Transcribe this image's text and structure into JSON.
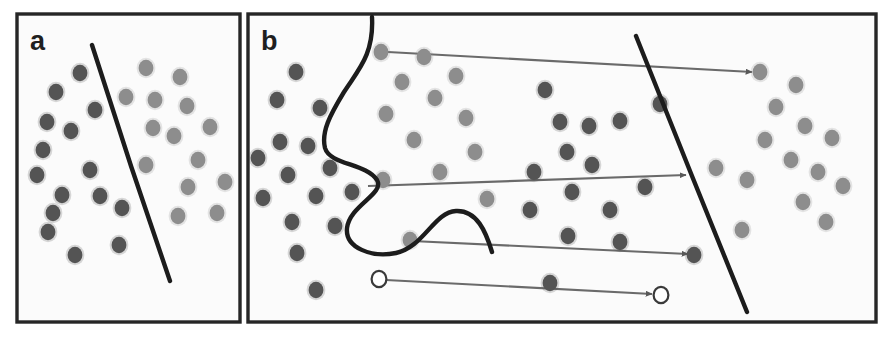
{
  "figure": {
    "background_color": "#ffffff",
    "width": 894,
    "height": 337
  },
  "colors": {
    "panel_border": "#262626",
    "panel_background": "#fbfbfb",
    "boundary_line": "#1c1c1c",
    "dot_class_a": "#545454",
    "dot_class_b": "#8d8d8d",
    "dot_outline_hollow": "#3a3a3a",
    "dot_hollow_fill": "#ffffff",
    "arrow": "#6a6a6a",
    "label_text": "#1f1f1f"
  },
  "panels": [
    {
      "id": "a",
      "label": "a",
      "caption": "",
      "box": {
        "x": 17,
        "y": 14,
        "width": 223,
        "height": 308
      },
      "boundary": {
        "type": "line",
        "name": "linear-decision-boundary",
        "path": "M 92 45 L 131 166 L 170 281"
      },
      "dots": [
        {
          "class": "a",
          "x": 47,
          "y": 122
        },
        {
          "class": "a",
          "x": 56,
          "y": 92
        },
        {
          "class": "a",
          "x": 80,
          "y": 73
        },
        {
          "class": "a",
          "x": 43,
          "y": 150
        },
        {
          "class": "a",
          "x": 71,
          "y": 131
        },
        {
          "class": "a",
          "x": 95,
          "y": 110
        },
        {
          "class": "a",
          "x": 37,
          "y": 175
        },
        {
          "class": "a",
          "x": 62,
          "y": 195
        },
        {
          "class": "a",
          "x": 90,
          "y": 170
        },
        {
          "class": "a",
          "x": 100,
          "y": 196
        },
        {
          "class": "a",
          "x": 53,
          "y": 213
        },
        {
          "class": "a",
          "x": 48,
          "y": 232
        },
        {
          "class": "a",
          "x": 75,
          "y": 255
        },
        {
          "class": "a",
          "x": 122,
          "y": 208
        },
        {
          "class": "a",
          "x": 119,
          "y": 245
        },
        {
          "class": "b",
          "x": 126,
          "y": 97
        },
        {
          "class": "b",
          "x": 146,
          "y": 68
        },
        {
          "class": "b",
          "x": 155,
          "y": 100
        },
        {
          "class": "b",
          "x": 180,
          "y": 77
        },
        {
          "class": "b",
          "x": 187,
          "y": 106
        },
        {
          "class": "b",
          "x": 153,
          "y": 128
        },
        {
          "class": "b",
          "x": 174,
          "y": 136
        },
        {
          "class": "b",
          "x": 210,
          "y": 127
        },
        {
          "class": "b",
          "x": 146,
          "y": 165
        },
        {
          "class": "b",
          "x": 198,
          "y": 160
        },
        {
          "class": "b",
          "x": 188,
          "y": 187
        },
        {
          "class": "b",
          "x": 225,
          "y": 182
        },
        {
          "class": "b",
          "x": 178,
          "y": 216
        },
        {
          "class": "b",
          "x": 217,
          "y": 213
        }
      ]
    },
    {
      "id": "b",
      "label": "b",
      "caption": "",
      "box": {
        "x": 248,
        "y": 14,
        "width": 628,
        "height": 308
      },
      "boundary": {
        "type": "curve",
        "name": "nonlinear-decision-boundary",
        "path": "M 372 17 C 374 55, 358 70, 344 92 C 330 115, 321 132, 325 148 C 330 165, 366 163, 377 180 C 385 194, 350 205, 347 228 C 345 248, 372 258, 396 253 C 424 247, 434 212, 456 211 C 477 210, 486 232, 492 252"
      },
      "boundary_secondary": {
        "type": "line",
        "name": "linear-decision-boundary-right",
        "path": "M 636 36 L 692 176 L 747 312"
      },
      "arrows": [
        {
          "name": "mapping-arrow-1",
          "x1": 388,
          "y1": 52,
          "x2": 752,
          "y2": 72,
          "source_dot": {
            "class": "b",
            "x": 381,
            "y": 52
          },
          "target_dot": {
            "class": "b",
            "x": 760,
            "y": 72
          }
        },
        {
          "name": "mapping-arrow-2",
          "x1": 368,
          "y1": 186,
          "x2": 686,
          "y2": 175,
          "source_dot": {
            "class": "b",
            "x": 383,
            "y": 180
          },
          "target_dot": {
            "class": "b",
            "x": 716,
            "y": 168
          }
        },
        {
          "name": "mapping-arrow-3",
          "x1": 412,
          "y1": 241,
          "x2": 688,
          "y2": 254,
          "source_dot": {
            "class": "b",
            "x": 410,
            "y": 240
          },
          "target_dot": {
            "class": "a",
            "x": 694,
            "y": 255
          }
        },
        {
          "name": "mapping-arrow-4",
          "x1": 386,
          "y1": 280,
          "x2": 652,
          "y2": 294,
          "source_dot": {
            "class": "hollow",
            "x": 379,
            "y": 279
          },
          "target_dot": {
            "class": "hollow",
            "x": 661,
            "y": 295
          }
        }
      ],
      "dots": [
        {
          "class": "a",
          "x": 277,
          "y": 100
        },
        {
          "class": "a",
          "x": 296,
          "y": 72
        },
        {
          "class": "a",
          "x": 320,
          "y": 108
        },
        {
          "class": "a",
          "x": 258,
          "y": 158
        },
        {
          "class": "a",
          "x": 280,
          "y": 142
        },
        {
          "class": "a",
          "x": 308,
          "y": 146
        },
        {
          "class": "a",
          "x": 288,
          "y": 175
        },
        {
          "class": "a",
          "x": 263,
          "y": 198
        },
        {
          "class": "a",
          "x": 316,
          "y": 196
        },
        {
          "class": "a",
          "x": 292,
          "y": 222
        },
        {
          "class": "a",
          "x": 335,
          "y": 226
        },
        {
          "class": "a",
          "x": 297,
          "y": 253
        },
        {
          "class": "a",
          "x": 316,
          "y": 290
        },
        {
          "class": "a",
          "x": 352,
          "y": 192
        },
        {
          "class": "a",
          "x": 330,
          "y": 168
        },
        {
          "class": "b",
          "x": 381,
          "y": 52
        },
        {
          "class": "b",
          "x": 424,
          "y": 57
        },
        {
          "class": "b",
          "x": 402,
          "y": 82
        },
        {
          "class": "b",
          "x": 435,
          "y": 98
        },
        {
          "class": "b",
          "x": 386,
          "y": 114
        },
        {
          "class": "b",
          "x": 456,
          "y": 76
        },
        {
          "class": "b",
          "x": 466,
          "y": 118
        },
        {
          "class": "b",
          "x": 414,
          "y": 140
        },
        {
          "class": "b",
          "x": 475,
          "y": 152
        },
        {
          "class": "b",
          "x": 383,
          "y": 180
        },
        {
          "class": "b",
          "x": 440,
          "y": 172
        },
        {
          "class": "b",
          "x": 487,
          "y": 199
        },
        {
          "class": "b",
          "x": 410,
          "y": 240
        },
        {
          "class": "a",
          "x": 545,
          "y": 90
        },
        {
          "class": "a",
          "x": 560,
          "y": 122
        },
        {
          "class": "a",
          "x": 589,
          "y": 126
        },
        {
          "class": "a",
          "x": 567,
          "y": 152
        },
        {
          "class": "a",
          "x": 592,
          "y": 165
        },
        {
          "class": "a",
          "x": 534,
          "y": 172
        },
        {
          "class": "a",
          "x": 572,
          "y": 192
        },
        {
          "class": "a",
          "x": 620,
          "y": 121
        },
        {
          "class": "a",
          "x": 530,
          "y": 210
        },
        {
          "class": "a",
          "x": 610,
          "y": 210
        },
        {
          "class": "a",
          "x": 568,
          "y": 236
        },
        {
          "class": "a",
          "x": 620,
          "y": 242
        },
        {
          "class": "a",
          "x": 645,
          "y": 187
        },
        {
          "class": "a",
          "x": 660,
          "y": 104
        },
        {
          "class": "a",
          "x": 550,
          "y": 283
        },
        {
          "class": "a",
          "x": 694,
          "y": 255
        },
        {
          "class": "b",
          "x": 760,
          "y": 72
        },
        {
          "class": "b",
          "x": 796,
          "y": 85
        },
        {
          "class": "b",
          "x": 776,
          "y": 107
        },
        {
          "class": "b",
          "x": 805,
          "y": 126
        },
        {
          "class": "b",
          "x": 765,
          "y": 140
        },
        {
          "class": "b",
          "x": 832,
          "y": 138
        },
        {
          "class": "b",
          "x": 791,
          "y": 160
        },
        {
          "class": "b",
          "x": 716,
          "y": 168
        },
        {
          "class": "b",
          "x": 747,
          "y": 180
        },
        {
          "class": "b",
          "x": 818,
          "y": 172
        },
        {
          "class": "b",
          "x": 843,
          "y": 186
        },
        {
          "class": "b",
          "x": 803,
          "y": 202
        },
        {
          "class": "b",
          "x": 826,
          "y": 222
        },
        {
          "class": "b",
          "x": 742,
          "y": 230
        }
      ]
    }
  ]
}
